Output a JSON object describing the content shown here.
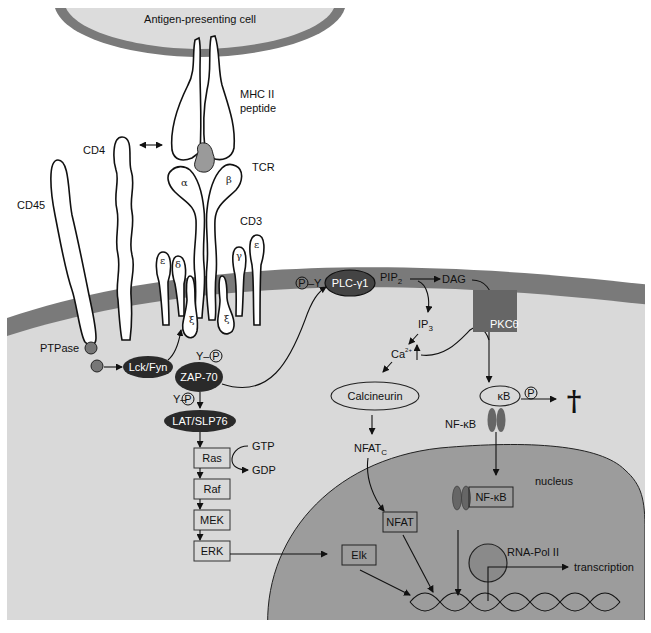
{
  "colors": {
    "background": "#ffffff",
    "cytoplasm": "#d9d9d9",
    "membrane": "#7a7a7a",
    "nucleus": "#9c9c9c",
    "apc_fill": "#dcdcdc",
    "dark_protein": "#2a2a2a",
    "pkc_box": "#666666",
    "gray_protein": "#777777",
    "rna_pol": "#8a8a8a"
  },
  "labels": {
    "apc": "Antigen-presenting cell",
    "mhc_line1": "MHC II",
    "mhc_line2": "peptide",
    "cd4": "CD4",
    "tcr": "TCR",
    "alpha": "α",
    "beta": "β",
    "cd3": "CD3",
    "epsilon_left": "ε",
    "delta": "δ",
    "gamma": "γ",
    "epsilon_right": "ε",
    "zeta_left": "ξ",
    "zeta_right": "ξ",
    "cd45": "CD45",
    "ptpase": "PTPase",
    "lck_fyn": "Lck/Fyn",
    "zap70": "ZAP-70",
    "y_p_upper": "Y–",
    "y_p_lower": "Y–",
    "p_symbol": "P",
    "lat_slp76": "LAT/SLP76",
    "ras": "Ras",
    "gtp": "GTP",
    "gdp": "GDP",
    "raf": "Raf",
    "mek": "MEK",
    "erk": "ERK",
    "plc_y": "–Y",
    "plc": "PLC-γ1",
    "pip2": "PIP",
    "pip2_sub": "2",
    "dag": "DAG",
    "ip3": "IP",
    "ip3_sub": "3",
    "ca": "Ca",
    "ca_sup": "2+",
    "pkc": "PKCθ",
    "calcineurin": "Calcineurin",
    "nfatc": "NFAT",
    "nfatc_sub": "C",
    "kb": "κB",
    "nfkb_cyto": "NF-κB",
    "dagger": "†",
    "nucleus": "nucleus",
    "nfkb_nuc": "NF-κB",
    "nfat": "NFAT",
    "elk": "Elk",
    "rna_pol": "RNA-Pol II",
    "transcription": "transcription"
  }
}
